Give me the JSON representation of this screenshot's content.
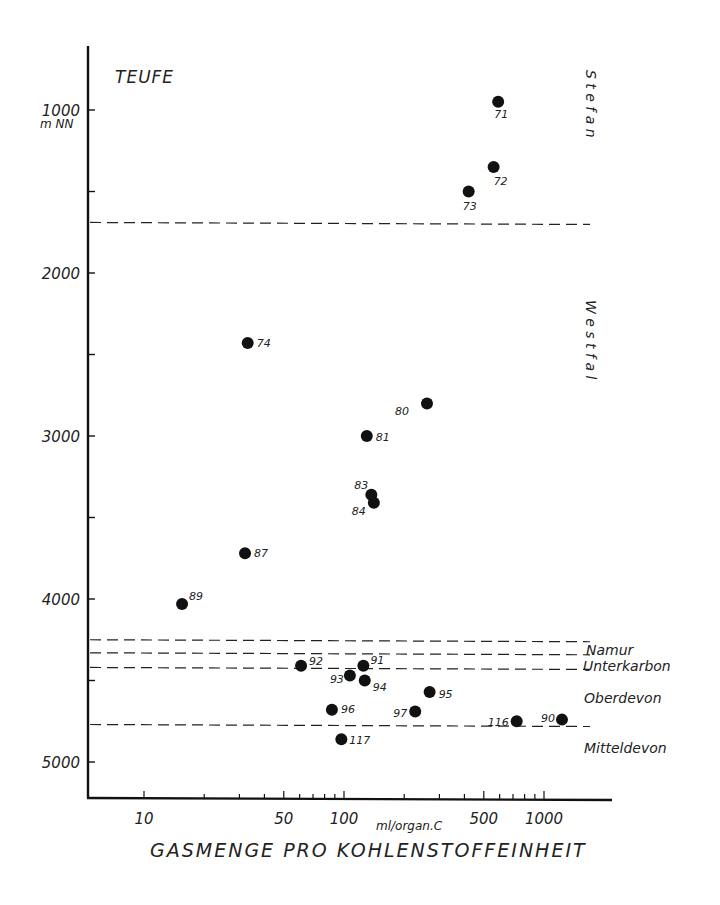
{
  "chart_data": {
    "type": "scatter",
    "title": "",
    "ylabel": "TEUFE",
    "ylabel_unit": "m NN",
    "xlabel": "GASMENGE PRO KOHLENSTOFFEINHEIT",
    "xlabel_unit": "ml/organ.C",
    "x_scale": "log",
    "y_inverted": true,
    "xlim": [
      6,
      2000
    ],
    "ylim": [
      600,
      5200
    ],
    "x_ticks": [
      "10",
      "50",
      "100",
      "500",
      "1000"
    ],
    "y_ticks": [
      "1000",
      "2000",
      "3000",
      "4000",
      "5000"
    ],
    "grid": false,
    "points": [
      {
        "label": "71",
        "x": 590,
        "y": 950
      },
      {
        "label": "72",
        "x": 560,
        "y": 1350
      },
      {
        "label": "73",
        "x": 420,
        "y": 1500
      },
      {
        "label": "74",
        "x": 33,
        "y": 2430
      },
      {
        "label": "80",
        "x": 260,
        "y": 2800
      },
      {
        "label": "81",
        "x": 130,
        "y": 3000
      },
      {
        "label": "83",
        "x": 137,
        "y": 3360
      },
      {
        "label": "84",
        "x": 141,
        "y": 3410
      },
      {
        "label": "87",
        "x": 32,
        "y": 3720
      },
      {
        "label": "89",
        "x": 15.5,
        "y": 4030
      },
      {
        "label": "92",
        "x": 61,
        "y": 4410
      },
      {
        "label": "91",
        "x": 125,
        "y": 4410
      },
      {
        "label": "93",
        "x": 107,
        "y": 4470
      },
      {
        "label": "94",
        "x": 127,
        "y": 4500
      },
      {
        "label": "95",
        "x": 268,
        "y": 4570
      },
      {
        "label": "96",
        "x": 87,
        "y": 4680
      },
      {
        "label": "97",
        "x": 227,
        "y": 4690
      },
      {
        "label": "116",
        "x": 730,
        "y": 4750
      },
      {
        "label": "90",
        "x": 1230,
        "y": 4740
      },
      {
        "label": "117",
        "x": 97,
        "y": 4860
      }
    ],
    "boundaries": [
      {
        "name": "Stefan/Westfal",
        "y": 1690
      },
      {
        "name": "Westfal/Namur",
        "y": 4250
      },
      {
        "name": "Namur/Unterkarbon",
        "y": 4330
      },
      {
        "name": "Unterkarbon/Oberdevon",
        "y": 4420
      },
      {
        "name": "Oberdevon/Mitteldevon",
        "y": 4770
      }
    ],
    "strata_labels": [
      "Stefan",
      "Westfal",
      "Namur",
      "Unterkarbon",
      "Oberdevon",
      "Mitteldevon"
    ]
  },
  "labels": {
    "y_title": "TEUFE",
    "y_unit": "m NN",
    "x_title": "GASMENGE PRO KOHLENSTOFFEINHEIT",
    "x_unit": "ml/organ.C",
    "strata": {
      "stefan": "S t e f a n",
      "westfal": "W e s t f a l",
      "namur": "Namur",
      "unterkarbon": "Unterkarbon",
      "oberdevon": "Oberdevon",
      "mitteldevon": "Mitteldevon"
    }
  },
  "style": {
    "ink": "#111111",
    "background": "#ffffff"
  }
}
